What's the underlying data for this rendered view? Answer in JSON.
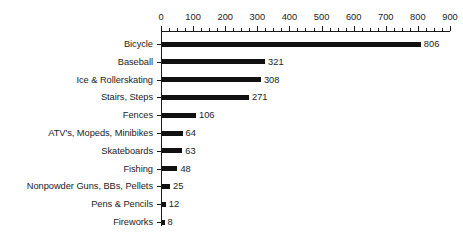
{
  "chart_data": {
    "type": "bar",
    "orientation": "horizontal",
    "title": "",
    "subtitle": "",
    "xlabel": "",
    "ylabel": "",
    "xlim": [
      0,
      900
    ],
    "x_major_step": 100,
    "x_minor_step": 25,
    "x_tick_labels": [
      "0",
      "100",
      "200",
      "300",
      "400",
      "500",
      "600",
      "700",
      "800",
      "900"
    ],
    "x_axis_position": "top",
    "grid": false,
    "legend": false,
    "bar_color": "#111111",
    "categories": [
      "Bicycle",
      "Baseball",
      "Ice & Rollerskating",
      "Stairs, Steps",
      "Fences",
      "ATV's, Mopeds, Minibikes",
      "Skateboards",
      "Fishing",
      "Nonpowder Guns, BBs, Pellets",
      "Pens & Pencils",
      "Fireworks"
    ],
    "values": [
      806,
      321,
      308,
      271,
      106,
      64,
      63,
      48,
      25,
      12,
      8
    ],
    "value_labels": [
      "806",
      "321",
      "308",
      "271",
      "106",
      "64",
      "63",
      "48",
      "25",
      "12",
      "8"
    ],
    "bars": [
      {
        "label": "Bicycle",
        "value": 806,
        "value_label": "806"
      },
      {
        "label": "Baseball",
        "value": 321,
        "value_label": "321"
      },
      {
        "label": "Ice & Rollerskating",
        "value": 308,
        "value_label": "308"
      },
      {
        "label": "Stairs, Steps",
        "value": 271,
        "value_label": "271"
      },
      {
        "label": "Fences",
        "value": 106,
        "value_label": "106"
      },
      {
        "label": "ATV's, Mopeds, Minibikes",
        "value": 64,
        "value_label": "64"
      },
      {
        "label": "Skateboards",
        "value": 63,
        "value_label": "63"
      },
      {
        "label": "Fishing",
        "value": 48,
        "value_label": "48"
      },
      {
        "label": "Nonpowder Guns, BBs, Pellets",
        "value": 25,
        "value_label": "25"
      },
      {
        "label": "Pens & Pencils",
        "value": 12,
        "value_label": "12"
      },
      {
        "label": "Fireworks",
        "value": 8,
        "value_label": "8"
      }
    ]
  },
  "layout": {
    "axis_origin_x": 0,
    "px_per_unit": 0.3211,
    "first_row_center_y": 44,
    "row_step_y": 17.8,
    "bar_thickness": 5,
    "value_label_gap": 3,
    "label_baseline_offset": 4
  }
}
